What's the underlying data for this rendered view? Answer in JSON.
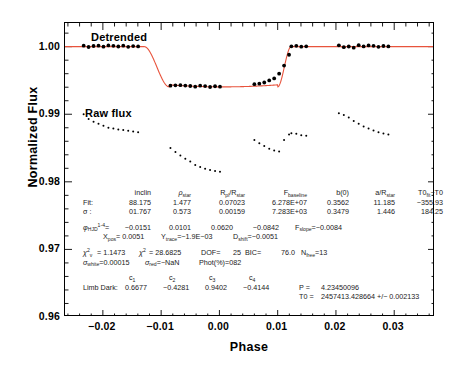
{
  "chart_data": {
    "type": "scatter",
    "title": "",
    "xlabel": "Phase",
    "ylabel": "Normalized Flux",
    "xlim": [
      -0.0265,
      0.037
    ],
    "ylim": [
      0.96,
      1.0035
    ],
    "xticks": [
      "-0.02",
      "-0.01",
      "0.00",
      "0.01",
      "0.02",
      "0.03"
    ],
    "xtick_values": [
      -0.02,
      -0.01,
      0.0,
      0.01,
      0.02,
      0.03
    ],
    "yticks": [
      "0.96",
      "0.97",
      "0.98",
      "0.99",
      "1.00"
    ],
    "ytick_values": [
      0.96,
      0.97,
      0.98,
      0.99,
      1.0
    ],
    "grid": false,
    "legend": "none",
    "annotations": [
      {
        "name": "detrended-label",
        "text": "Detrended",
        "x": -0.022,
        "y": 1.0022
      },
      {
        "name": "raw-flux-label",
        "text": "Raw flux",
        "x": -0.0232,
        "y": 0.9908
      }
    ],
    "series": [
      {
        "name": "Detrended flux",
        "marker": "filled-circle",
        "color": "#000000",
        "points": [
          [
            -0.0233,
            1.00015
          ],
          [
            -0.02245,
            0.99995
          ],
          [
            -0.0216,
            1.0001
          ],
          [
            -0.02075,
            1.00015
          ],
          [
            -0.0199,
            1.0
          ],
          [
            -0.01905,
            1.00018
          ],
          [
            -0.0182,
            1.00012
          ],
          [
            -0.01735,
            1.00002
          ],
          [
            -0.0165,
            1.00014
          ],
          [
            -0.01565,
            0.99998
          ],
          [
            -0.0148,
            1.00008
          ],
          [
            -0.01395,
            1.00003
          ],
          [
            -0.0084,
            0.99423
          ],
          [
            -0.00755,
            0.99428
          ],
          [
            -0.0067,
            0.9943
          ],
          [
            -0.00585,
            0.99424
          ],
          [
            -0.005,
            0.99418
          ],
          [
            -0.00415,
            0.99408
          ],
          [
            -0.0033,
            0.99422
          ],
          [
            -0.00245,
            0.99417
          ],
          [
            -0.0016,
            0.99403
          ],
          [
            -0.00075,
            0.99414
          ],
          [
            0.0001,
            0.99408
          ],
          [
            0.006,
            0.99445
          ],
          [
            0.00685,
            0.99452
          ],
          [
            0.0077,
            0.9947
          ],
          [
            0.00855,
            0.995
          ],
          [
            0.0094,
            0.9953
          ],
          [
            0.01025,
            0.996
          ],
          [
            0.0111,
            0.9972
          ],
          [
            0.01195,
            0.9988
          ],
          [
            0.01235,
            1.00005
          ],
          [
            0.0132,
            1.00012
          ],
          [
            0.01405,
            1.0
          ],
          [
            0.0149,
            1.00005
          ],
          [
            0.0205,
            1.0002
          ],
          [
            0.02135,
            0.99992
          ],
          [
            0.0222,
            1.00002
          ],
          [
            0.02305,
            0.99985
          ],
          [
            0.0239,
            1.00022
          ],
          [
            0.02475,
            1.00004
          ],
          [
            0.0256,
            1.00018
          ],
          [
            0.02645,
            1.00012
          ],
          [
            0.0273,
            0.99998
          ],
          [
            0.02815,
            1.0001
          ],
          [
            0.029,
            1.00003
          ]
        ]
      },
      {
        "name": "Raw flux",
        "marker": "small-dot",
        "color": "#000000",
        "points": [
          [
            -0.0233,
            0.99
          ],
          [
            -0.02245,
            0.9893
          ],
          [
            -0.0216,
            0.9889
          ],
          [
            -0.02075,
            0.9886
          ],
          [
            -0.0199,
            0.9883
          ],
          [
            -0.01905,
            0.988
          ],
          [
            -0.0182,
            0.9879
          ],
          [
            -0.01735,
            0.98775
          ],
          [
            -0.0165,
            0.98765
          ],
          [
            -0.01565,
            0.98755
          ],
          [
            -0.0148,
            0.98745
          ],
          [
            -0.01395,
            0.98735
          ],
          [
            -0.0084,
            0.985
          ],
          [
            -0.00755,
            0.9844
          ],
          [
            -0.0067,
            0.9839
          ],
          [
            -0.00585,
            0.9834
          ],
          [
            -0.005,
            0.983
          ],
          [
            -0.00415,
            0.9825
          ],
          [
            -0.0033,
            0.9822
          ],
          [
            -0.00245,
            0.98195
          ],
          [
            -0.0016,
            0.98175
          ],
          [
            -0.00075,
            0.9816
          ],
          [
            0.0001,
            0.9815
          ],
          [
            0.006,
            0.9862
          ],
          [
            0.00685,
            0.9857
          ],
          [
            0.0077,
            0.9853
          ],
          [
            0.00855,
            0.9849
          ],
          [
            0.0094,
            0.98465
          ],
          [
            0.01025,
            0.9845
          ],
          [
            0.0111,
            0.9862
          ],
          [
            0.01195,
            0.987
          ],
          [
            0.01235,
            0.9872
          ],
          [
            0.0132,
            0.9871
          ],
          [
            0.01405,
            0.9869
          ],
          [
            0.0149,
            0.9868
          ],
          [
            0.0205,
            0.99015
          ],
          [
            0.02135,
            0.9899
          ],
          [
            0.0222,
            0.9895
          ],
          [
            0.02305,
            0.989
          ],
          [
            0.0239,
            0.9886
          ],
          [
            0.02475,
            0.9882
          ],
          [
            0.0256,
            0.9879
          ],
          [
            0.02645,
            0.9876
          ],
          [
            0.0273,
            0.98735
          ],
          [
            0.02815,
            0.98715
          ],
          [
            0.029,
            0.987
          ]
        ]
      }
    ],
    "model": {
      "name": "Transit model fit",
      "color": "#e8533c",
      "baseline": 1.0,
      "depth": 0.00595,
      "ingress_start": -0.0129,
      "ingress_end": -0.0086,
      "egress_start": 0.01,
      "egress_end": 0.0123,
      "floor": 0.99405
    }
  },
  "fit_table": {
    "headers": [
      "inclin",
      "ρ",
      "R/R",
      "F",
      "b(0)",
      "a/R",
      "T0"
    ],
    "header_cells": [
      {
        "main": "inclin",
        "sub": ""
      },
      {
        "main": "ρ",
        "sub": "star"
      },
      {
        "main": "R",
        "sub": "pl",
        "tail": "/R",
        "tail_sub": "star"
      },
      {
        "main": "F",
        "sub": "baseline"
      },
      {
        "main": "b(0)",
        "sub": ""
      },
      {
        "main": "a/R",
        "sub": "star"
      },
      {
        "main": "T0",
        "sub": "fit",
        "tail": "−T0",
        "tail_sub": ""
      }
    ],
    "rows": [
      {
        "label": "Fit:",
        "values": [
          "88.175",
          "1.477",
          "0.07023",
          "6.278E+07",
          "0.3562",
          "11.185",
          "−355.93"
        ]
      },
      {
        "label": "σ :",
        "values": [
          "01.767",
          "0.573",
          "0.00159",
          "7.283E+03",
          "0.3479",
          "1.446",
          "184.25"
        ]
      }
    ]
  },
  "phase_row": {
    "symbol": "φ",
    "symbol_sub": "HJD",
    "symbol_sup": "1-4",
    "eq": "=",
    "values": [
      "−0.0151",
      "0.0101",
      "0.0620",
      "−0.0842"
    ],
    "fslope_label": "F",
    "fslope_sub": "slope",
    "fslope_value": "=−0.0084"
  },
  "pos_row": {
    "x_label": "X",
    "x_sub": "pos",
    "x_value": "= 0.0051",
    "y_label": "Y",
    "y_sub": "trace",
    "y_value": "=−1.9E−03",
    "d_label": "D",
    "d_sub": "shift",
    "d_value": "=−0.0051"
  },
  "stats_row1": {
    "chi_nu_label": "χ",
    "chi_nu_sup": "2",
    "chi_nu_sub": "ν",
    "chi_nu_value": "=  1.1473",
    "chi2_label": "χ",
    "chi2_sup": "2",
    "chi2_value": "=  28.6825",
    "dof_label": "DOF=",
    "dof_value": "25",
    "bic_label": "BIC=",
    "bic_value": "76.0",
    "nfree_label": "N",
    "nfree_sub": "free",
    "nfree_value": "=13"
  },
  "stats_row2": {
    "white_label": "σ",
    "white_sub": "white",
    "white_value": "=0.00015",
    "red_label": "σ",
    "red_sub": "red",
    "red_value": "=−NaN",
    "phot_label": "Phot(%)=",
    "phot_value": "082"
  },
  "limb_dark": {
    "label": "Limb Dark:",
    "coef_headers": [
      "c",
      "c",
      "c",
      "c"
    ],
    "coef_subs": [
      "1",
      "2",
      "3",
      "4"
    ],
    "values": [
      "0.6677",
      "−0.4281",
      "0.9402",
      "−0.4144"
    ]
  },
  "ephemeris": {
    "period_label": "P  =",
    "period_value": "4.23450096",
    "t0_label": "T0 =",
    "t0_value": "2457413.428664 +/− 0.002133"
  },
  "colors": {
    "model_line": "#e8533c",
    "data_points": "#000000",
    "axis": "#000000",
    "background": "#ffffff",
    "text": "#1a1a1a"
  }
}
